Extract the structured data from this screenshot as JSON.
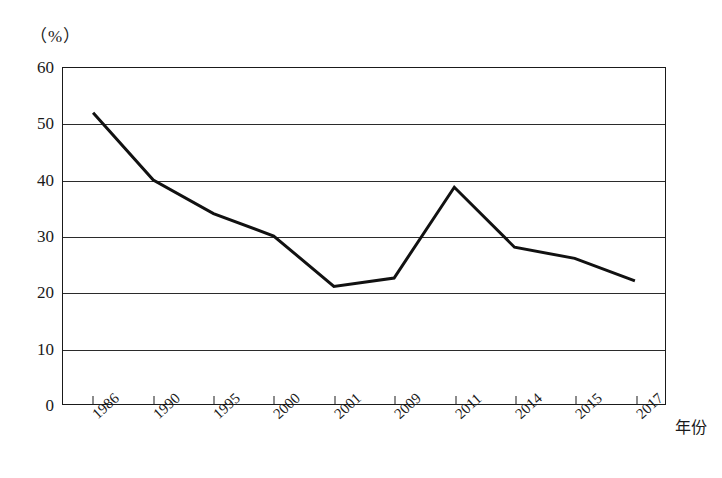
{
  "chart_data": {
    "type": "line",
    "title": "",
    "subtitle": "",
    "xlabel": "年份",
    "ylabel": "",
    "unit_label": "（%）",
    "grid": true,
    "legend": false,
    "xlim_categories": [
      "1986",
      "1990",
      "1995",
      "2000",
      "2001",
      "2009",
      "2011",
      "2014",
      "2015",
      "2017"
    ],
    "ylim": [
      0,
      60
    ],
    "ytick_step": 10,
    "yticks": [
      "60",
      "50",
      "40",
      "30",
      "20",
      "10",
      "0"
    ],
    "categories": [
      "1986",
      "1990",
      "1995",
      "2000",
      "2001",
      "2009",
      "2011",
      "2014",
      "2015",
      "2017"
    ],
    "values": [
      52,
      40,
      34,
      30,
      21,
      22.5,
      38.7,
      28,
      26,
      22
    ],
    "series": [
      {
        "name": "",
        "values": [
          52,
          40,
          34,
          30,
          21,
          22.5,
          38.7,
          28,
          26,
          22
        ],
        "color": "#111111",
        "line_width": 3
      }
    ],
    "annotations": []
  },
  "axis": {
    "unit": "（%）",
    "x_title": "年份"
  },
  "colors": {
    "line": "#111111",
    "frame": "#1a1a1a",
    "grid": "#2b2b2b",
    "background": "#ffffff"
  }
}
